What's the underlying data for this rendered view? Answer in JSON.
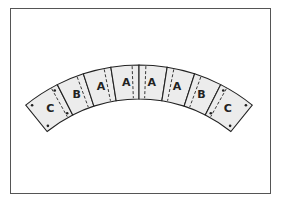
{
  "diagram": {
    "type": "arch-of-curved-blocks",
    "colors": {
      "block_fill": "#ececec",
      "stroke": "#222222",
      "frame": "#555555"
    },
    "geometry": {
      "cx": 139,
      "cy": 245,
      "r_inner": 146,
      "r_outer": 180
    },
    "segments": [
      {
        "label": "C",
        "span": 12,
        "dash": "right",
        "dots": true
      },
      {
        "label": "B",
        "span": 9,
        "dash": "left"
      },
      {
        "label": "A",
        "span": 9,
        "dash": "left"
      },
      {
        "label": "A",
        "span": 9,
        "dash": "left"
      },
      {
        "label": "A",
        "span": 9,
        "dash": "left_of_right"
      },
      {
        "label": "A",
        "span": 9,
        "dash": "left"
      },
      {
        "label": "B",
        "span": 9,
        "dash": "left"
      },
      {
        "label": "C",
        "span": 12,
        "dash": "left",
        "dots": true
      }
    ]
  }
}
